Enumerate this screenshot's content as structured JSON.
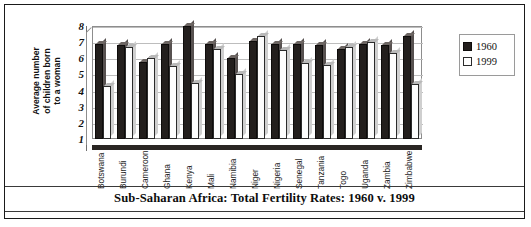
{
  "chart_data": {
    "type": "bar",
    "title": "Sub-Saharan Africa: Total Fertility Rates: 1960 v. 1999",
    "xlabel": "",
    "ylabel": "Average number of children born to a woman",
    "ylabel_lines": [
      "Average number",
      "of children born",
      "to a woman"
    ],
    "ylim": [
      1,
      8
    ],
    "yticks": [
      8,
      7,
      6,
      5,
      4,
      3,
      2,
      1
    ],
    "grid": true,
    "legend_position": "right",
    "categories": [
      "Botswana",
      "Burundi",
      "Cameroon",
      "Ghana",
      "Kenya",
      "Mali",
      "Namibia",
      "Niger",
      "Nigeria",
      "Senegal",
      "Tanzania",
      "Togo",
      "Uganda",
      "Zambia",
      "Zimbabwe"
    ],
    "series": [
      {
        "name": "1960",
        "color": "#231f1d",
        "values": [
          6.9,
          6.8,
          5.8,
          6.9,
          8.0,
          6.9,
          6.0,
          7.1,
          6.9,
          6.9,
          6.8,
          6.6,
          6.9,
          6.8,
          7.4
        ]
      },
      {
        "name": "1999",
        "color": "#ffffff",
        "values": [
          4.3,
          6.7,
          6.0,
          5.5,
          4.5,
          6.6,
          5.0,
          7.4,
          6.5,
          5.7,
          5.6,
          6.7,
          7.0,
          6.3,
          4.4
        ]
      }
    ]
  },
  "legend": {
    "entries": [
      {
        "label": "1960",
        "swatch": "black"
      },
      {
        "label": "1999",
        "swatch": "white"
      }
    ]
  }
}
